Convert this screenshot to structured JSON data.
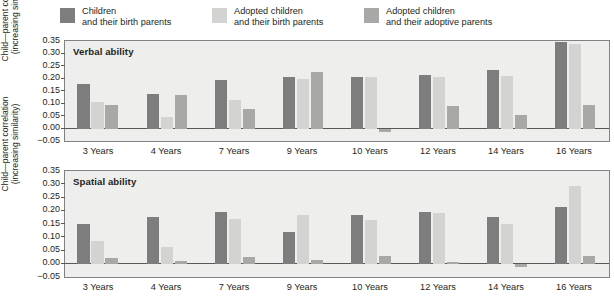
{
  "legend": {
    "entries": [
      {
        "name": "children-birth-parents",
        "line1": "Children",
        "line2": "and their birth parents",
        "color": "#7d7d7d"
      },
      {
        "name": "adopted-children-birth-parents",
        "line1": "Adopted children",
        "line2": "and their birth parents",
        "color": "#d3d3d1"
      },
      {
        "name": "adopted-children-adoptive-parents",
        "line1": "Adopted children",
        "line2": "and their adoptive parents",
        "color": "#a8a8a6"
      }
    ]
  },
  "axis": {
    "ylabel_line1": "Child—parent correlation",
    "ylabel_line2": "(increasing similarity)",
    "ticks": [
      "0.35",
      "0.30",
      "0.25",
      "0.20",
      "0.15",
      "0.10",
      "0.05",
      "0.00",
      "−0.05"
    ],
    "ymin": -0.05,
    "ymax": 0.35
  },
  "chart_data": [
    {
      "type": "bar",
      "title": "Verbal ability",
      "xlabel": "",
      "ylabel": "Child—parent correlation (increasing similarity)",
      "categories": [
        "3 Years",
        "4 Years",
        "7 Years",
        "9 Years",
        "10 Years",
        "12 Years",
        "14 Years",
        "16 Years"
      ],
      "ylim": [
        -0.05,
        0.35
      ],
      "yticks": [
        -0.05,
        0.0,
        0.05,
        0.1,
        0.15,
        0.2,
        0.25,
        0.3,
        0.35
      ],
      "grid": false,
      "legend_position": "top",
      "series": [
        {
          "name": "Children and their birth parents",
          "color": "#7d7d7d",
          "values": [
            0.18,
            0.14,
            0.195,
            0.205,
            0.205,
            0.215,
            0.235,
            0.345
          ]
        },
        {
          "name": "Adopted children and their birth parents",
          "color": "#d3d3d1",
          "values": [
            0.105,
            0.045,
            0.115,
            0.2,
            0.205,
            0.205,
            0.21,
            0.34
          ]
        },
        {
          "name": "Adopted children and their adoptive parents",
          "color": "#a8a8a6",
          "values": [
            0.095,
            0.135,
            0.08,
            0.225,
            -0.012,
            0.09,
            0.055,
            0.095
          ]
        }
      ]
    },
    {
      "type": "bar",
      "title": "Spatial ability",
      "xlabel": "",
      "ylabel": "Child—parent correlation (increasing similarity)",
      "categories": [
        "3 Years",
        "4 Years",
        "7 Years",
        "9 Years",
        "10 Years",
        "12 Years",
        "14 Years",
        "16 Years"
      ],
      "ylim": [
        -0.05,
        0.35
      ],
      "yticks": [
        -0.05,
        0.0,
        0.05,
        0.1,
        0.15,
        0.2,
        0.25,
        0.3,
        0.35
      ],
      "grid": false,
      "legend_position": "top",
      "series": [
        {
          "name": "Children and their birth parents",
          "color": "#7d7d7d",
          "values": [
            0.15,
            0.175,
            0.195,
            0.12,
            0.185,
            0.195,
            0.175,
            0.215
          ]
        },
        {
          "name": "Adopted children and their birth parents",
          "color": "#d3d3d1",
          "values": [
            0.085,
            0.065,
            0.17,
            0.185,
            0.165,
            0.19,
            0.15,
            0.295
          ]
        },
        {
          "name": "Adopted children and their adoptive parents",
          "color": "#a8a8a6",
          "values": [
            0.02,
            0.012,
            0.025,
            0.015,
            0.03,
            0.005,
            -0.012,
            0.03
          ]
        }
      ]
    }
  ]
}
